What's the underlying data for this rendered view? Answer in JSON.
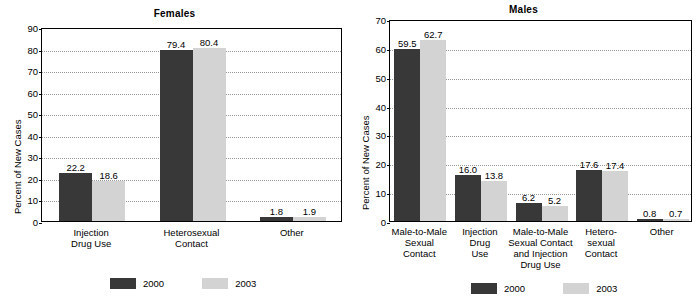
{
  "chart_data": [
    {
      "type": "bar",
      "title": "Females",
      "xlabel": "",
      "ylabel": "Percent of New Cases",
      "ylim": [
        0,
        90
      ],
      "ytick_step": 10,
      "yticks": [
        0,
        10,
        20,
        30,
        40,
        50,
        60,
        70,
        80,
        90
      ],
      "grid": true,
      "legend_position": "bottom",
      "categories": [
        "Injection Drug Use",
        "Heterosexual Contact",
        "Other"
      ],
      "category_lines": [
        [
          "Injection",
          "Drug Use"
        ],
        [
          "Heterosexual",
          "Contact"
        ],
        [
          "Other"
        ]
      ],
      "series": [
        {
          "name": "2000",
          "color": "#383838",
          "values": [
            22.2,
            79.4,
            1.8
          ],
          "labels": [
            "22.2",
            "79.4",
            "1.8"
          ]
        },
        {
          "name": "2003",
          "color": "#d3d3d3",
          "values": [
            18.6,
            80.4,
            1.9
          ],
          "labels": [
            "18.6",
            "80.4",
            "1.9"
          ]
        }
      ]
    },
    {
      "type": "bar",
      "title": "Males",
      "xlabel": "",
      "ylabel": "Percent of New Cases",
      "ylim": [
        0,
        70
      ],
      "ytick_step": 10,
      "yticks": [
        0,
        10,
        20,
        30,
        40,
        50,
        60,
        70
      ],
      "grid": true,
      "legend_position": "bottom",
      "categories": [
        "Male-to-Male Sexual Contact",
        "Injection Drug Use",
        "Male-to-Male Sexual Contact and Injection Drug Use",
        "Heterosexual Contact",
        "Other"
      ],
      "category_lines": [
        [
          "Male-to-Male",
          "Sexual",
          "Contact"
        ],
        [
          "Injection",
          "Drug",
          "Use"
        ],
        [
          "Male-to-Male",
          "Sexual Contact",
          "and Injection",
          "Drug Use"
        ],
        [
          "Hetero-",
          "sexual",
          "Contact"
        ],
        [
          "Other"
        ]
      ],
      "series": [
        {
          "name": "2000",
          "color": "#383838",
          "values": [
            59.5,
            16.0,
            6.2,
            17.6,
            0.8
          ],
          "labels": [
            "59.5",
            "16.0",
            "6.2",
            "17.6",
            "0.8"
          ]
        },
        {
          "name": "2003",
          "color": "#d3d3d3",
          "values": [
            62.7,
            13.8,
            5.2,
            17.4,
            0.7
          ],
          "labels": [
            "62.7",
            "13.8",
            "5.2",
            "17.4",
            "0.7"
          ]
        }
      ]
    }
  ],
  "females": {
    "title": "Females",
    "ylabel": "Percent of New Cases",
    "yticks": [
      "0",
      "10",
      "20",
      "30",
      "40",
      "50",
      "60",
      "70",
      "80",
      "90"
    ],
    "legend": {
      "label_2000": "2000",
      "label_2003": "2003"
    }
  },
  "males": {
    "title": "Males",
    "ylabel": "Percent of New Cases",
    "yticks": [
      "0",
      "10",
      "20",
      "30",
      "40",
      "50",
      "60",
      "70"
    ],
    "legend": {
      "label_2000": "2000",
      "label_2003": "2003"
    }
  },
  "colors": {
    "series_2000": "#383838",
    "series_2003": "#d3d3d3",
    "grid": "#9a9a9a",
    "axis": "#000000"
  }
}
